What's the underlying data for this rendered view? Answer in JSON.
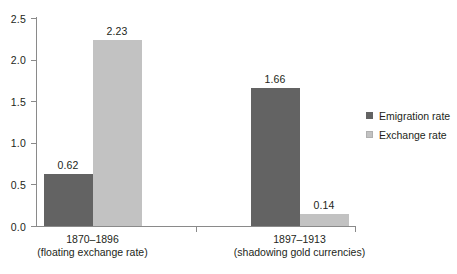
{
  "chart_data": {
    "type": "bar",
    "title": "",
    "subtitle": "",
    "xlabel": "",
    "ylabel": "",
    "ylim": [
      0.0,
      2.5
    ],
    "ytick_labels": [
      "0.0",
      "0.5",
      "1.0",
      "1.5",
      "2.0",
      "2.5"
    ],
    "ytick_values": [
      0.0,
      0.5,
      1.0,
      1.5,
      2.0,
      2.5
    ],
    "grid": false,
    "legend_position": "right",
    "categories": [
      {
        "line1": "1870–1896",
        "line2": "(floating exchange rate)"
      },
      {
        "line1": "1897–1913",
        "line2": "(shadowing gold currencies)"
      }
    ],
    "series": [
      {
        "name": "Emigration rate",
        "color": "#636363",
        "values": [
          0.62,
          1.66
        ],
        "labels": [
          "0.62",
          "1.66"
        ]
      },
      {
        "name": "Exchange rate",
        "color": "#c2c2c2",
        "values": [
          2.23,
          0.14
        ],
        "labels": [
          "2.23",
          "0.14"
        ]
      }
    ]
  },
  "legend": {
    "items": [
      {
        "label": "Emigration rate",
        "color": "#636363"
      },
      {
        "label": "Exchange rate",
        "color": "#c2c2c2"
      }
    ]
  },
  "axes": {
    "y_max_label": "2.5",
    "y_min_label": "0.0"
  }
}
